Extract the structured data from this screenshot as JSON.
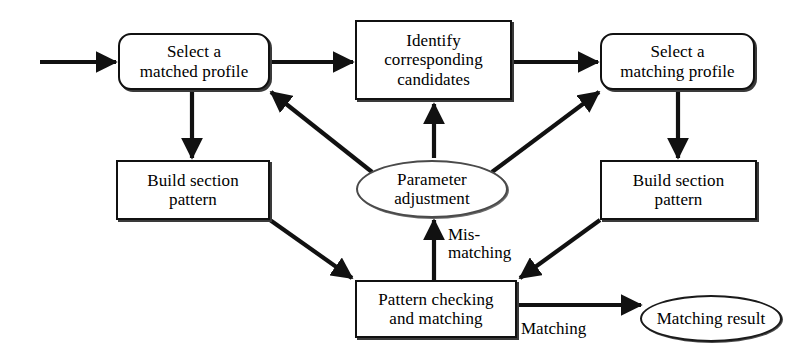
{
  "diagram": {
    "nodes": [
      {
        "id": "select_matched_profile",
        "label": "Select a\nmatched profile",
        "shape": "rounded-rect",
        "x": 118,
        "y": 33,
        "w": 152,
        "h": 57,
        "font_size": 17
      },
      {
        "id": "identify_candidates",
        "label": "Identify\ncorresponding\ncandidates",
        "shape": "rect",
        "x": 355,
        "y": 20,
        "w": 157,
        "h": 80,
        "font_size": 17
      },
      {
        "id": "select_matching_profile",
        "label": "Select a\nmatching profile",
        "shape": "rounded-rect",
        "x": 600,
        "y": 33,
        "w": 155,
        "h": 57,
        "font_size": 17
      },
      {
        "id": "build_section_pattern_left",
        "label": "Build section\npattern",
        "shape": "rect",
        "x": 116,
        "y": 160,
        "w": 154,
        "h": 60,
        "font_size": 17
      },
      {
        "id": "parameter_adjustment",
        "label": "Parameter\nadjustment",
        "shape": "ellipse",
        "x": 356,
        "y": 160,
        "w": 152,
        "h": 58,
        "font_size": 17
      },
      {
        "id": "build_section_pattern_right",
        "label": "Build section\npattern",
        "shape": "rect",
        "x": 600,
        "y": 160,
        "w": 157,
        "h": 60,
        "font_size": 17
      },
      {
        "id": "pattern_checking_matching",
        "label": "Pattern checking\nand matching",
        "shape": "rect",
        "x": 355,
        "y": 280,
        "w": 162,
        "h": 58,
        "font_size": 17
      },
      {
        "id": "matching_result",
        "label": "Matching result",
        "shape": "ellipse-dark",
        "x": 640,
        "y": 295,
        "w": 142,
        "h": 47,
        "font_size": 17
      }
    ],
    "edge_labels": [
      {
        "id": "mismatching_label",
        "text": "Mis-\nmatching",
        "x": 448,
        "y": 226,
        "font_size": 17
      },
      {
        "id": "matching_label",
        "text": "Matching",
        "x": 521,
        "y": 320,
        "font_size": 17
      }
    ],
    "edges": [
      {
        "id": "entry-to-select-matched",
        "from": "entry",
        "to": "select_matched_profile",
        "label": ""
      },
      {
        "id": "select-matched-to-identify",
        "from": "select_matched_profile",
        "to": "identify_candidates",
        "label": ""
      },
      {
        "id": "identify-to-select-matching",
        "from": "identify_candidates",
        "to": "select_matching_profile",
        "label": ""
      },
      {
        "id": "select-matched-to-build-left",
        "from": "select_matched_profile",
        "to": "build_section_pattern_left",
        "label": ""
      },
      {
        "id": "select-matching-to-build-right",
        "from": "select_matching_profile",
        "to": "build_section_pattern_right",
        "label": ""
      },
      {
        "id": "build-left-to-pattern-checking",
        "from": "build_section_pattern_left",
        "to": "pattern_checking_matching",
        "label": ""
      },
      {
        "id": "build-right-to-pattern-checking",
        "from": "build_section_pattern_right",
        "to": "pattern_checking_matching",
        "label": ""
      },
      {
        "id": "pattern-checking-to-parameter",
        "from": "pattern_checking_matching",
        "to": "parameter_adjustment",
        "label": "Mis-matching"
      },
      {
        "id": "parameter-to-identify",
        "from": "parameter_adjustment",
        "to": "identify_candidates",
        "label": ""
      },
      {
        "id": "parameter-to-select-matched",
        "from": "parameter_adjustment",
        "to": "select_matched_profile",
        "label": ""
      },
      {
        "id": "parameter-to-select-matching",
        "from": "parameter_adjustment",
        "to": "select_matching_profile",
        "label": ""
      },
      {
        "id": "pattern-checking-to-matching-result",
        "from": "pattern_checking_matching",
        "to": "matching_result",
        "label": "Matching"
      }
    ]
  },
  "style": {
    "stroke": "#111111",
    "ellipse_stroke": "#4a4a4a",
    "background": "#ffffff",
    "text_color": "#000000"
  }
}
